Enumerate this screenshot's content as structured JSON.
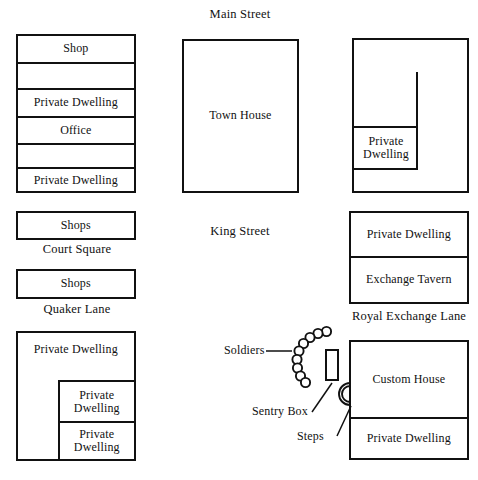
{
  "figure": {
    "type": "historical-site-map",
    "title_visible": false,
    "background_color": "#ffffff",
    "line_color": "#111111"
  },
  "streets": [
    {
      "name": "main-street",
      "label": "Main Street"
    },
    {
      "name": "king-street",
      "label": "King Street"
    },
    {
      "name": "court-square",
      "label": "Court Square"
    },
    {
      "name": "quaker-lane",
      "label": "Quaker Lane"
    },
    {
      "name": "royal-exchange-lane",
      "label": "Royal Exchange Lane"
    }
  ],
  "blocks": {
    "northwest_row_building": {
      "rooms": [
        {
          "label": "Shop"
        },
        {
          "label": ""
        },
        {
          "label": "Private Dwelling"
        },
        {
          "label": "Office"
        },
        {
          "label": ""
        },
        {
          "label": "Private Dwelling"
        }
      ]
    },
    "town_house": {
      "label": "Town House"
    },
    "northeast_building": {
      "inner_room": {
        "label": "Private Dwelling"
      }
    },
    "court_square_shops": {
      "label": "Shops"
    },
    "quaker_lane_shops": {
      "label": "Shops"
    },
    "exchange_building": {
      "rooms": [
        {
          "label": "Private Dwelling"
        },
        {
          "label": "Exchange Tavern"
        }
      ]
    },
    "southwest_building": {
      "rooms": [
        {
          "label": "Private Dwelling"
        },
        {
          "label": "Private\nDwelling"
        },
        {
          "label": "Private\nDwelling"
        }
      ],
      "room_top_label": "Private Dwelling",
      "room_mid_label_line1": "Private",
      "room_mid_label_line2": "Dwelling",
      "room_bot_label_line1": "Private",
      "room_bot_label_line2": "Dwelling"
    },
    "custom_house_building": {
      "rooms": [
        {
          "label": "Custom House"
        },
        {
          "label": "Private Dwelling"
        }
      ]
    }
  },
  "annotations": [
    {
      "name": "soldiers",
      "label": "Soldiers",
      "count": 9
    },
    {
      "name": "sentry-box",
      "label": "Sentry Box"
    },
    {
      "name": "steps",
      "label": "Steps"
    }
  ]
}
